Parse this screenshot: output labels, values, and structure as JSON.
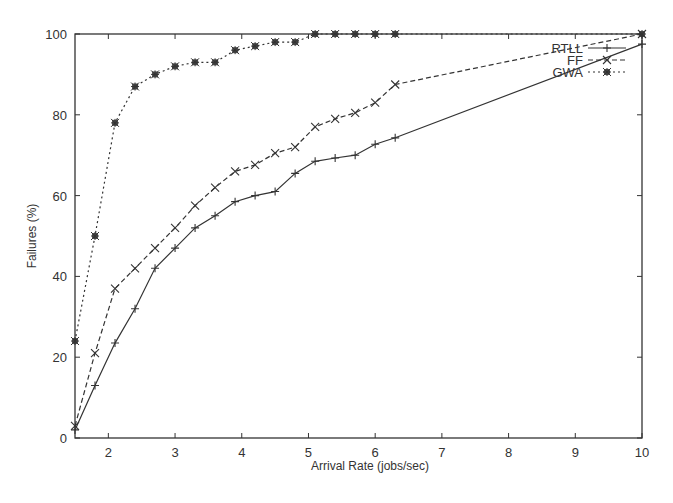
{
  "chart_data": {
    "type": "line",
    "title": "",
    "xlabel": "Arrival Rate (jobs/sec)",
    "ylabel": "Failures (%)",
    "xlim": [
      1.5,
      10
    ],
    "ylim": [
      0,
      100
    ],
    "xticks": [
      2,
      3,
      4,
      5,
      6,
      7,
      8,
      9,
      10
    ],
    "yticks": [
      0,
      20,
      40,
      60,
      80,
      100
    ],
    "grid": false,
    "legend_position": "top-right",
    "series": [
      {
        "name": "RTLL",
        "line_style": "solid",
        "marker": "plus",
        "x": [
          1.5,
          1.8,
          2.1,
          2.4,
          2.7,
          3.0,
          3.3,
          3.6,
          3.9,
          4.2,
          4.5,
          4.8,
          5.1,
          5.4,
          5.7,
          6.0,
          6.3,
          10
        ],
        "values": [
          2,
          13,
          23.5,
          32,
          42,
          47,
          52,
          55,
          58.5,
          60,
          61,
          65.5,
          68.5,
          69.3,
          70,
          72.7,
          74.3,
          97.5
        ]
      },
      {
        "name": "FF",
        "line_style": "dashed",
        "marker": "cross",
        "x": [
          1.5,
          1.8,
          2.1,
          2.4,
          2.7,
          3.0,
          3.3,
          3.6,
          3.9,
          4.2,
          4.5,
          4.8,
          5.1,
          5.4,
          5.7,
          6.0,
          6.3,
          10
        ],
        "values": [
          3,
          21,
          37,
          42,
          47,
          52,
          57.5,
          62,
          66,
          67.6,
          70.5,
          72,
          77,
          79,
          80.5,
          83,
          87.5,
          100
        ]
      },
      {
        "name": "GWA",
        "line_style": "dotted",
        "marker": "star",
        "x": [
          1.5,
          1.8,
          2.1,
          2.4,
          2.7,
          3.0,
          3.3,
          3.6,
          3.9,
          4.2,
          4.5,
          4.8,
          5.1,
          5.4,
          5.7,
          6.0,
          6.3,
          10
        ],
        "values": [
          24,
          50,
          78,
          87,
          90,
          92,
          93,
          93,
          96,
          97,
          98,
          98,
          100,
          100,
          100,
          100,
          100,
          100
        ]
      }
    ]
  },
  "colors": {
    "line": "#333333",
    "axis": "#333333",
    "background": "#ffffff"
  }
}
